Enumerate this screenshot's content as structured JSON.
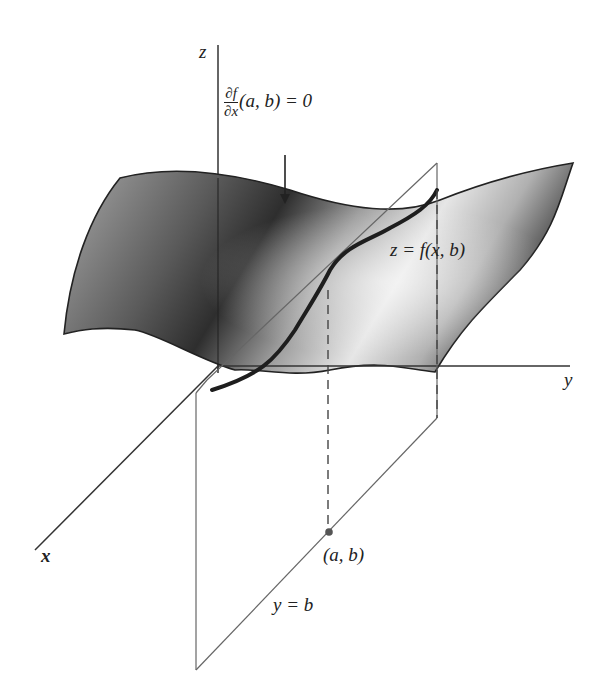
{
  "figure": {
    "axes": {
      "x_label": "x",
      "y_label": "y",
      "z_label": "z"
    },
    "annotations": {
      "partial_num": "∂f",
      "partial_den": "∂x",
      "partial_rest": "(a, b) = 0",
      "trace_curve": "z = f(x, b)",
      "point": "(a, b)",
      "plane": "y = b"
    },
    "colors": {
      "surface_dark": "#2e2e2e",
      "surface_mid": "#7a7a7a",
      "surface_light": "#e8e8e8",
      "axis": "#333333",
      "plane_edge": "#666666",
      "curve": "#1e1e1e",
      "point": "#555555"
    }
  }
}
